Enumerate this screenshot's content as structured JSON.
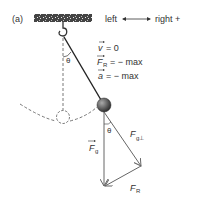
{
  "panel_label": "(a)",
  "direction": {
    "left": "left",
    "right": "right +"
  },
  "conditions": [
    {
      "symbol": "v",
      "sub": "",
      "rhs": "= 0"
    },
    {
      "symbol": "F",
      "sub": "R",
      "rhs": "= − max"
    },
    {
      "symbol": "a",
      "sub": "",
      "rhs": "= − max"
    }
  ],
  "angle_label": "θ",
  "forces": {
    "gravity": {
      "symbol": "F",
      "sub": "g"
    },
    "perpendicular": {
      "symbol": "F",
      "sub": "g⊥"
    },
    "restoring": {
      "symbol": "F",
      "sub": "R"
    }
  },
  "colors": {
    "line": "#333333",
    "force": "#666666",
    "dashed": "#555555",
    "bob": "#555555"
  }
}
